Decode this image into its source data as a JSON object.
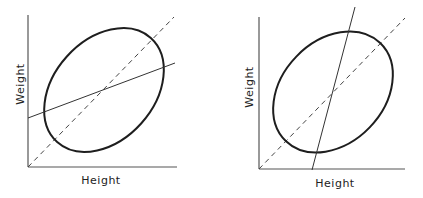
{
  "panels": [
    {
      "id": "left",
      "xlabel": "Height",
      "ylabel": "Weight",
      "description": "Ellipse of data with 45-degree dashed line and shallow solid regression line (weight on height)"
    },
    {
      "id": "right",
      "xlabel": "Height",
      "ylabel": "Weight",
      "description": "Ellipse of data with 45-degree dashed line and steep solid regression line (height on weight)"
    }
  ],
  "colors": {
    "ink": "#1e1e1e",
    "axis": "#555555",
    "background": "#ffffff"
  }
}
